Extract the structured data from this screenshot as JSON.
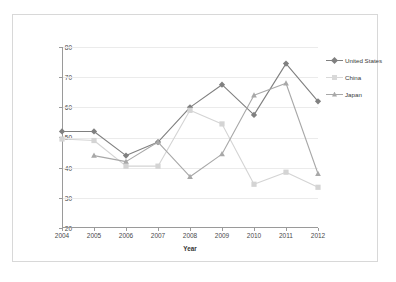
{
  "chart_data": {
    "type": "line",
    "title": "",
    "xlabel": "Year",
    "ylabel": "Percentage of respondents with favorable attitude",
    "categories": [
      "2004",
      "2005",
      "2006",
      "2007",
      "2008",
      "2009",
      "2010",
      "2011",
      "2012"
    ],
    "x": [
      2004,
      2005,
      2006,
      2007,
      2008,
      2009,
      2010,
      2011,
      2012
    ],
    "xlim": [
      2004,
      2012
    ],
    "ylim": [
      20,
      80
    ],
    "yticks": [
      20,
      30,
      40,
      50,
      60,
      70,
      80
    ],
    "xticks": [
      "2004",
      "2005",
      "2006",
      "2007",
      "2008",
      "2009",
      "2010",
      "2011",
      "2012"
    ],
    "grid": true,
    "legend_position": "right",
    "series": [
      {
        "name": "United States",
        "color": "#808080",
        "marker": "diamond",
        "values": [
          52,
          52,
          44,
          48.5,
          60,
          67.5,
          57.5,
          74.5,
          62
        ]
      },
      {
        "name": "China",
        "color": "#d4d4d4",
        "marker": "square",
        "values": [
          49.5,
          49,
          40.5,
          40.5,
          59,
          54.5,
          34.5,
          38.5,
          33.5
        ]
      },
      {
        "name": "Japan",
        "color": "#a8a8a8",
        "marker": "triangle",
        "values": [
          null,
          44,
          42,
          48.5,
          37,
          44.5,
          64,
          68,
          38
        ]
      }
    ]
  },
  "axes": {
    "y_tick_labels": [
      "80",
      "70",
      "60",
      "50",
      "40",
      "30",
      "20"
    ],
    "x_tick_labels": [
      "2004",
      "2005",
      "2006",
      "2007",
      "2008",
      "2009",
      "2010",
      "2011",
      "2012"
    ],
    "y_axis_title": "Percentage of respondents with favorable attitude",
    "x_axis_title": "Year"
  },
  "legend": {
    "items": [
      {
        "label": "United States"
      },
      {
        "label": "China"
      },
      {
        "label": "Japan"
      }
    ]
  }
}
